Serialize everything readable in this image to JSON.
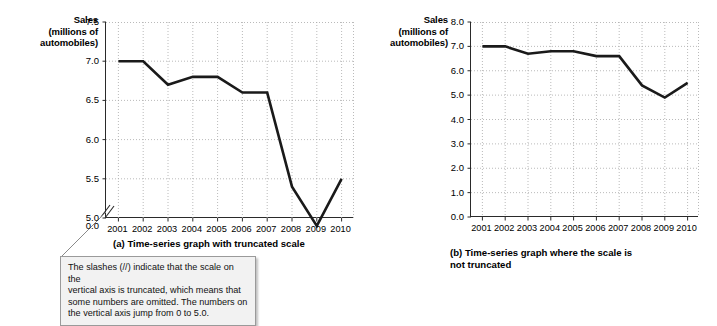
{
  "figure": {
    "axis_title_line1": "Sales",
    "axis_title_line2": "(millions of",
    "axis_title_line3": "automobiles)",
    "caption_a": "(a) Time-series graph with truncated scale",
    "caption_b_line1": "(b) Time-series graph where the scale is",
    "caption_b_line2": "not truncated",
    "line_color": "#1a1a1a",
    "grid_color": "#a8a8a8",
    "axis_color": "#2a2a2a"
  },
  "note": {
    "line1": "The slashes (//) indicate that the scale on the",
    "line2": "vertical axis is truncated, which means that",
    "line3": "some numbers are omitted.  The numbers on",
    "line4": "the vertical axis jump from 0 to 5.0."
  },
  "chart_data": [
    {
      "id": "truncated",
      "type": "line",
      "title": "(a) Time-series graph with truncated scale",
      "ylabel": "Sales (millions of automobiles)",
      "xlabel": "",
      "categories": [
        "2001",
        "2002",
        "2003",
        "2004",
        "2005",
        "2006",
        "2007",
        "2008",
        "2009",
        "2010"
      ],
      "values": [
        7.0,
        7.0,
        6.7,
        6.8,
        6.8,
        6.6,
        6.6,
        5.4,
        4.9,
        5.5
      ],
      "ylim": [
        5.0,
        7.5
      ],
      "yticks": [
        "7.5",
        "7.0",
        "6.5",
        "6.0",
        "5.5",
        "5.0",
        "0.0"
      ],
      "ytick_values": [
        7.5,
        7.0,
        6.5,
        6.0,
        5.5,
        5.0,
        0.0
      ],
      "truncated_axis": true,
      "truncation_between": [
        "5.0",
        "0.0"
      ],
      "grid": true,
      "legend": "none"
    },
    {
      "id": "not-truncated",
      "type": "line",
      "title": "(b) Time-series graph where the scale is not truncated",
      "ylabel": "Sales (millions of automobiles)",
      "xlabel": "",
      "categories": [
        "2001",
        "2002",
        "2003",
        "2004",
        "2005",
        "2006",
        "2007",
        "2008",
        "2009",
        "2010"
      ],
      "values": [
        7.0,
        7.0,
        6.7,
        6.8,
        6.8,
        6.6,
        6.6,
        5.4,
        4.9,
        5.5
      ],
      "ylim": [
        0.0,
        8.0
      ],
      "yticks": [
        "8.0",
        "7.0",
        "6.0",
        "5.0",
        "4.0",
        "3.0",
        "2.0",
        "1.0",
        "0.0"
      ],
      "ytick_values": [
        8.0,
        7.0,
        6.0,
        5.0,
        4.0,
        3.0,
        2.0,
        1.0,
        0.0
      ],
      "truncated_axis": false,
      "grid": true,
      "legend": "none"
    }
  ]
}
